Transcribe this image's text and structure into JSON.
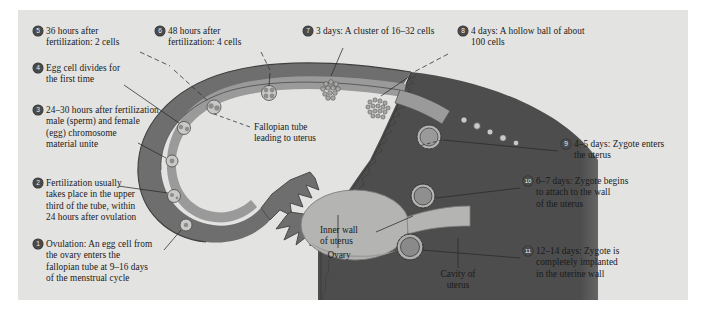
{
  "figure": {
    "background_color": "#e3e3e1",
    "page_color": "#ffffff"
  },
  "colors": {
    "panel": "#e3e3e1",
    "tube_outer_wall": "#6e6e6e",
    "tube_lumen": "#9a9a9a",
    "uterus_wall": "#4d4d4d",
    "ovary": "#b4b4b2",
    "marker": "#4a4a4a",
    "marker_text": "#f0f0ee",
    "text": "#1a1a1a",
    "leader_line": "#2a2a2a"
  },
  "steps": [
    {
      "number": "1",
      "lines": [
        "Ovulation:  An egg cell from",
        "the ovary enters the",
        "fallopian tube at 9–16 days",
        "of the menstrual cycle"
      ]
    },
    {
      "number": "2",
      "lines": [
        "Fertilization usually",
        "takes place in the upper",
        "third of the tube, within",
        "24 hours after ovulation"
      ]
    },
    {
      "number": "3",
      "lines": [
        "24–30 hours after fertilization",
        "male (sperm) and female",
        "(egg) chromosome",
        "material unite"
      ]
    },
    {
      "number": "4",
      "lines": [
        "Egg cell divides for",
        "the first time"
      ]
    },
    {
      "number": "5",
      "lines": [
        "36 hours after",
        "fertilization:  2 cells"
      ]
    },
    {
      "number": "6",
      "lines": [
        "48 hours after",
        "fertilization:  4 cells"
      ]
    },
    {
      "number": "7",
      "lines": [
        "3 days:  A cluster of 16–32 cells"
      ]
    },
    {
      "number": "8",
      "lines": [
        "4 days:  A hollow ball of about",
        "100 cells"
      ]
    },
    {
      "number": "9",
      "lines": [
        "4–5 days:  Zygote enters",
        "the uterus"
      ]
    },
    {
      "number": "10",
      "lines": [
        "6–7 days:  Zygote begins",
        "to attach to the wall",
        "of the uterus"
      ]
    },
    {
      "number": "11",
      "lines": [
        "12–14 days:  Zygote is",
        "completely implanted",
        "in the uterine wall"
      ]
    }
  ],
  "anatomy_labels": [
    {
      "id": "fallopian-tube",
      "lines": [
        "Fallopian tube",
        "leading to uterus"
      ]
    },
    {
      "id": "ovary",
      "lines": [
        "Ovary"
      ]
    },
    {
      "id": "inner-wall-of-uterus",
      "lines": [
        "Inner wall",
        "of uterus"
      ]
    },
    {
      "id": "cavity-of-uterus",
      "lines": [
        "Cavity of",
        "uterus"
      ]
    }
  ]
}
